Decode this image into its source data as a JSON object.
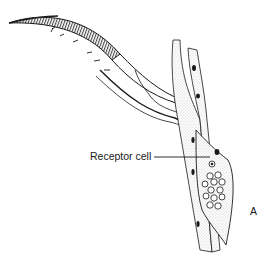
{
  "figure": {
    "labels": {
      "receptor": "Receptor cell",
      "panel": "A"
    },
    "colors": {
      "ink": "#1a1a1a",
      "stipple": "#9a9a9a",
      "background": "#ffffff"
    }
  }
}
